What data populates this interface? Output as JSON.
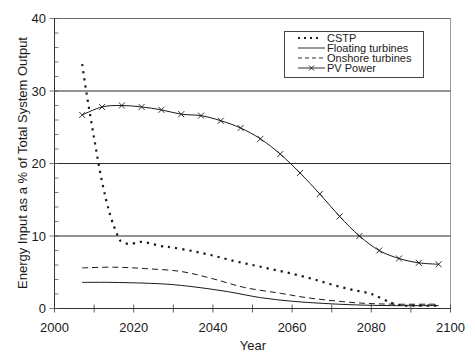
{
  "chart_data": {
    "type": "line",
    "title": "",
    "xlabel": "Year",
    "ylabel": "Energy Input as a % of Total System Output",
    "xlim": [
      2000,
      2100
    ],
    "ylim": [
      0,
      40
    ],
    "x_ticks": [
      2000,
      2020,
      2040,
      2060,
      2080,
      2100
    ],
    "y_ticks": [
      0,
      10,
      20,
      30,
      40
    ],
    "grid": {
      "horizontal": [
        10,
        20,
        30
      ],
      "vertical": false
    },
    "legend_position": "upper right",
    "series": [
      {
        "name": "CSTP",
        "style": "dotted",
        "marker": "none",
        "x": [
          2007,
          2008,
          2010,
          2012,
          2014,
          2016,
          2017,
          2019,
          2021,
          2022,
          2024,
          2027,
          2030,
          2035,
          2040,
          2045,
          2050,
          2055,
          2060,
          2065,
          2070,
          2075,
          2080,
          2085,
          2088,
          2090,
          2097
        ],
        "values": [
          33.7,
          30.0,
          23.5,
          17.5,
          13.0,
          10.0,
          9.2,
          8.9,
          9.1,
          9.2,
          9.0,
          8.6,
          8.4,
          7.9,
          7.3,
          6.6,
          6.0,
          5.4,
          4.8,
          4.1,
          3.3,
          2.6,
          2.0,
          0.8,
          0.4,
          0.4,
          0.4
        ]
      },
      {
        "name": "Floating turbines",
        "style": "solid",
        "marker": "none",
        "x": [
          2007,
          2015,
          2027,
          2035,
          2044,
          2052,
          2060,
          2068,
          2076,
          2085,
          2097
        ],
        "values": [
          3.6,
          3.6,
          3.4,
          3.0,
          2.3,
          1.5,
          1.0,
          0.7,
          0.5,
          0.4,
          0.4
        ]
      },
      {
        "name": "Onshore turbines",
        "style": "dashed",
        "marker": "none",
        "x": [
          2007,
          2015,
          2023,
          2032,
          2040,
          2048,
          2057,
          2065,
          2076,
          2085,
          2097
        ],
        "values": [
          5.6,
          5.7,
          5.5,
          5.1,
          4.1,
          2.9,
          2.1,
          1.4,
          0.8,
          0.6,
          0.6
        ]
      },
      {
        "name": "PV Power",
        "style": "solid",
        "marker": "x",
        "x": [
          2007,
          2012,
          2017,
          2022,
          2027,
          2032,
          2037,
          2042,
          2047,
          2052,
          2057,
          2062,
          2067,
          2072,
          2077,
          2082,
          2087,
          2092,
          2097
        ],
        "values": [
          26.7,
          27.8,
          28.0,
          27.8,
          27.4,
          26.8,
          26.6,
          25.9,
          24.9,
          23.4,
          21.3,
          18.7,
          15.8,
          12.7,
          10.0,
          8.0,
          6.9,
          6.3,
          6.1
        ]
      }
    ]
  },
  "axes": {
    "x_title": "Year",
    "y_title": "Energy Input as a % of Total System Output",
    "x_tick_labels": [
      "2000",
      "2020",
      "2040",
      "2060",
      "2080",
      "2100"
    ],
    "y_tick_labels": [
      "0",
      "10",
      "20",
      "30",
      "40"
    ]
  },
  "legend": {
    "items": [
      {
        "label": "CSTP",
        "icon": "dotted-line-icon"
      },
      {
        "label": "Floating turbines",
        "icon": "solid-line-icon"
      },
      {
        "label": "Onshore turbines",
        "icon": "dashed-line-icon"
      },
      {
        "label": "PV Power",
        "icon": "x-marker-line-icon"
      }
    ]
  },
  "colors": {
    "line": "#1a1a1a",
    "grid": "#2a2a2a",
    "frame": "#8a8a8a",
    "background": "#ffffff"
  }
}
